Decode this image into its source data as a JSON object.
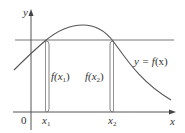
{
  "figure": {
    "axes": {
      "x_label": "x",
      "y_label": "y",
      "origin_label": "0"
    },
    "curve": {
      "label_prefix": "y = ",
      "label_func": "f",
      "label_arg": "(x)"
    },
    "points": [
      {
        "name": "x",
        "sub": "1",
        "value_label_prefix": "f(x",
        "value_label_suffix": ")"
      },
      {
        "name": "x",
        "sub": "2",
        "value_label_prefix": "f(x",
        "value_label_suffix": ")"
      }
    ],
    "colors": {
      "line": "#555555",
      "curve": "#555555",
      "text": "#333333"
    }
  }
}
